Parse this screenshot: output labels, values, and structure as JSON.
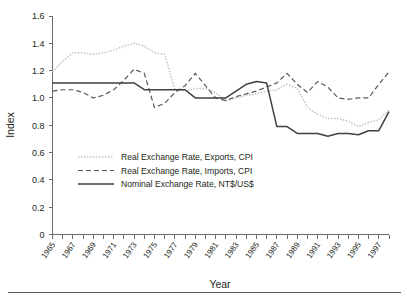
{
  "chart_data": {
    "type": "line",
    "title": "",
    "xlabel": "Year",
    "ylabel": "Index",
    "xlim": [
      1965,
      1998
    ],
    "ylim": [
      0,
      1.6
    ],
    "ytick_labels": [
      "0",
      "0.2",
      "0.4",
      "0.6",
      "0.8",
      "1.0",
      "1.2",
      "1.4",
      "1.6"
    ],
    "ytick_values": [
      0,
      0.2,
      0.4,
      0.6,
      0.8,
      1.0,
      1.2,
      1.4,
      1.6
    ],
    "xtick_labels": [
      "1965",
      "1967",
      "1969",
      "1971",
      "1973",
      "1975",
      "1977",
      "1979",
      "1981",
      "1983",
      "1985",
      "1987",
      "1989",
      "1991",
      "1993",
      "1995",
      "1997"
    ],
    "xtick_values": [
      1965,
      1967,
      1969,
      1971,
      1973,
      1975,
      1977,
      1979,
      1981,
      1983,
      1985,
      1987,
      1989,
      1991,
      1993,
      1995,
      1997
    ],
    "grid": false,
    "legend_position": "inside-lower-left",
    "x": [
      1965,
      1966,
      1967,
      1968,
      1969,
      1970,
      1971,
      1972,
      1973,
      1974,
      1975,
      1976,
      1977,
      1978,
      1979,
      1980,
      1981,
      1982,
      1983,
      1984,
      1985,
      1986,
      1987,
      1988,
      1989,
      1990,
      1991,
      1992,
      1993,
      1994,
      1995,
      1996,
      1997,
      1998
    ],
    "series": [
      {
        "name": "Real Exchange Rate, Exports, CPI",
        "style": "dotted",
        "color": "#bcbec0",
        "values": [
          1.19,
          1.27,
          1.33,
          1.33,
          1.32,
          1.33,
          1.35,
          1.38,
          1.4,
          1.38,
          1.33,
          1.32,
          1.06,
          1.05,
          1.07,
          1.07,
          1.04,
          0.98,
          1.0,
          1.02,
          1.03,
          1.05,
          1.06,
          1.1,
          1.07,
          0.93,
          0.88,
          0.85,
          0.85,
          0.83,
          0.79,
          0.82,
          0.84,
          0.91
        ]
      },
      {
        "name": "Real Exchange Rate, Imports, CPI",
        "style": "dashed",
        "color": "#58595b",
        "values": [
          1.05,
          1.06,
          1.06,
          1.04,
          1.0,
          1.02,
          1.06,
          1.13,
          1.21,
          1.18,
          0.93,
          0.96,
          1.04,
          1.09,
          1.18,
          1.09,
          1.0,
          0.98,
          1.01,
          1.03,
          1.05,
          1.08,
          1.11,
          1.18,
          1.1,
          1.04,
          1.12,
          1.08,
          1.0,
          0.99,
          1.0,
          1.0,
          1.1,
          1.19
        ]
      },
      {
        "name": "Nominal Exchange Rate, NT$/US$",
        "style": "solid",
        "color": "#414042",
        "values": [
          1.11,
          1.11,
          1.11,
          1.11,
          1.11,
          1.11,
          1.11,
          1.11,
          1.11,
          1.06,
          1.06,
          1.06,
          1.06,
          1.06,
          1.0,
          1.0,
          1.0,
          1.0,
          1.05,
          1.07,
          1.11,
          1.12,
          1.11,
          1.11,
          1.1,
          1.11,
          1.11,
          1.1,
          0.79,
          0.79,
          0.77,
          0.74,
          0.74,
          0.75
        ]
      }
    ],
    "series_nominal_detail": {
      "note": "Nominal line drops sharply after 1986",
      "x2": [
        1965,
        1973,
        1974,
        1978,
        1979,
        1982,
        1983,
        1984,
        1985,
        1986,
        1987,
        1988,
        1989,
        1990,
        1991,
        1992,
        1993,
        1994,
        1995,
        1996,
        1997,
        1998
      ],
      "y2": [
        1.11,
        1.11,
        1.06,
        1.06,
        1.0,
        1.0,
        1.05,
        1.1,
        1.12,
        1.11,
        0.79,
        0.79,
        0.74,
        0.74,
        0.74,
        0.72,
        0.74,
        0.74,
        0.73,
        0.76,
        0.76,
        0.9
      ]
    }
  },
  "legend": {
    "items": [
      {
        "label": "Real Exchange Rate, Exports, CPI",
        "style": "dotted"
      },
      {
        "label": "Real Exchange Rate, Imports, CPI",
        "style": "dashed"
      },
      {
        "label": "Nominal Exchange Rate, NT$/US$",
        "style": "solid"
      }
    ]
  },
  "axis": {
    "y_title": "Index",
    "x_title": "Year"
  },
  "colors": {
    "exports": "#bcbec0",
    "imports": "#58595b",
    "nominal": "#414042",
    "axis": "#6d6e71",
    "text": "#231f20"
  }
}
